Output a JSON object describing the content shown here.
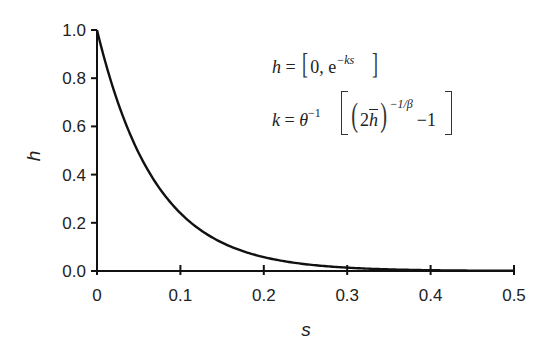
{
  "chart_data": {
    "type": "line",
    "title": "",
    "xlabel": "s",
    "ylabel": "h",
    "xlim": [
      0,
      0.5
    ],
    "ylim": [
      0,
      1.0
    ],
    "x_ticks": [
      "0",
      "0.1",
      "0.2",
      "0.3",
      "0.4",
      "0.5"
    ],
    "y_ticks": [
      "0.0",
      "0.2",
      "0.4",
      "0.6",
      "0.8",
      "1.0"
    ],
    "grid": false,
    "legend": null,
    "series": [
      {
        "name": "h = e^{-ks}",
        "x": [
          0,
          0.025,
          0.05,
          0.075,
          0.1,
          0.125,
          0.15,
          0.2,
          0.25,
          0.3,
          0.35,
          0.4,
          0.45,
          0.5
        ],
        "values": [
          1.0,
          0.7,
          0.5,
          0.35,
          0.24,
          0.17,
          0.12,
          0.06,
          0.03,
          0.015,
          0.007,
          0.004,
          0.002,
          0.001
        ]
      }
    ],
    "annotations": [
      "h = [0, e^{-ks}]",
      "k = θ^{-1} [ (2h̄)^{-1/β} - 1 ]"
    ]
  },
  "equations": {
    "eq1": {
      "lhs": "h",
      "eq": " = ",
      "open": "[",
      "body": "0, e",
      "exp": "−ks",
      "close": "]"
    },
    "eq2": {
      "lhs": "k",
      "eq": " = ",
      "theta": "θ",
      "theta_exp": "−1",
      "two": "2",
      "hbar": "h",
      "exp": "−1/β",
      "minus_one": "−1"
    }
  }
}
